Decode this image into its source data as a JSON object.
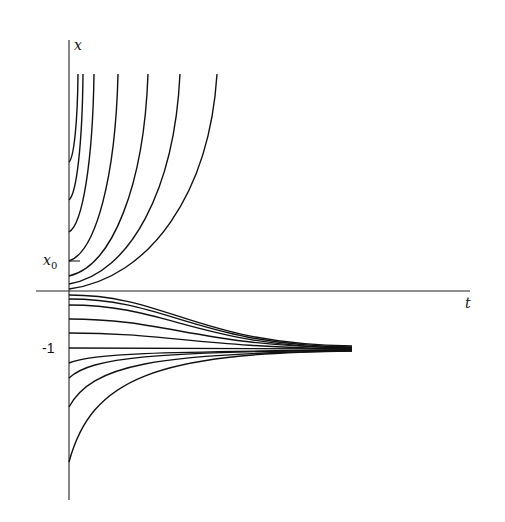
{
  "chart_data": {
    "type": "line",
    "title": "",
    "xlabel": "t",
    "ylabel": "x",
    "tick_labels": {
      "y": [
        "x0",
        "-1"
      ]
    },
    "annotations": [
      {
        "text": "x",
        "position": "top of vertical axis"
      },
      {
        "text": "t",
        "position": "right end of horizontal axis"
      },
      {
        "text": "x0",
        "subscript": "0",
        "position": "tick on vertical axis above origin"
      },
      {
        "text": "-1",
        "position": "tick on vertical axis below origin"
      }
    ],
    "grid": false,
    "legend": "none",
    "series": [
      {
        "name": "upper-1",
        "start_px": [
          69,
          162
        ],
        "end_px": [
          78,
          74
        ],
        "behavior": "blow-up"
      },
      {
        "name": "upper-2",
        "start_px": [
          69,
          200
        ],
        "end_px": [
          83,
          74
        ],
        "behavior": "blow-up"
      },
      {
        "name": "upper-3",
        "start_px": [
          69,
          232
        ],
        "end_px": [
          94,
          74
        ],
        "behavior": "blow-up"
      },
      {
        "name": "upper-4",
        "start_px": [
          69,
          261
        ],
        "end_px": [
          118,
          74
        ],
        "behavior": "blow-up"
      },
      {
        "name": "upper-5",
        "start_px": [
          69,
          276
        ],
        "end_px": [
          148,
          74
        ],
        "behavior": "blow-up"
      },
      {
        "name": "upper-6",
        "start_px": [
          69,
          284
        ],
        "end_px": [
          180,
          74
        ],
        "behavior": "blow-up"
      },
      {
        "name": "upper-7",
        "start_px": [
          69,
          289
        ],
        "end_px": [
          217,
          74
        ],
        "behavior": "blow-up"
      },
      {
        "name": "lower-1",
        "start_px": [
          69,
          295
        ],
        "end_px": [
          352,
          346
        ],
        "behavior": "converge to -1"
      },
      {
        "name": "lower-2",
        "start_px": [
          69,
          299
        ],
        "end_px": [
          352,
          347
        ],
        "behavior": "converge to -1"
      },
      {
        "name": "lower-3",
        "start_px": [
          69,
          305
        ],
        "end_px": [
          352,
          348
        ],
        "behavior": "converge to -1"
      },
      {
        "name": "lower-4",
        "start_px": [
          69,
          319
        ],
        "end_px": [
          352,
          348
        ],
        "behavior": "converge to -1"
      },
      {
        "name": "lower-5",
        "start_px": [
          69,
          333
        ],
        "end_px": [
          352,
          349
        ],
        "behavior": "converge to -1"
      },
      {
        "name": "equilibrium",
        "start_px": [
          69,
          348
        ],
        "end_px": [
          352,
          349
        ],
        "behavior": "constant -1"
      },
      {
        "name": "lower-6",
        "start_px": [
          69,
          363
        ],
        "end_px": [
          352,
          350
        ],
        "behavior": "converge to -1"
      },
      {
        "name": "lower-7",
        "start_px": [
          69,
          378
        ],
        "end_px": [
          352,
          350
        ],
        "behavior": "converge to -1"
      },
      {
        "name": "lower-8",
        "start_px": [
          69,
          407
        ],
        "end_px": [
          352,
          351
        ],
        "behavior": "converge to -1"
      },
      {
        "name": "lower-9",
        "start_px": [
          69,
          462
        ],
        "end_px": [
          352,
          351
        ],
        "behavior": "converge to -1"
      }
    ],
    "axes_px": {
      "origin": [
        69,
        291
      ],
      "x_end": 470,
      "y_top": 40,
      "y_bottom": 500,
      "x0_tick_y": 261,
      "minus1_y": 348
    }
  },
  "labels": {
    "y_axis": "x",
    "x_axis": "t",
    "x0_main": "x",
    "x0_sub": "0",
    "minus_one": "-1"
  },
  "colors": {
    "ink": "#111111",
    "background": "#ffffff"
  }
}
